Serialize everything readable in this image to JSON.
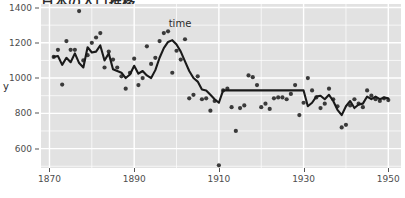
{
  "chart_data": {
    "type": "scatter",
    "title": "日本の人口推移",
    "xlabel": "time",
    "ylabel": "y",
    "xlim": [
      1868,
      1953
    ],
    "ylim": [
      490,
      1420
    ],
    "grid": true,
    "legend": "none",
    "x_ticks": [
      1870,
      1890,
      1910,
      1930,
      1950
    ],
    "y_ticks": [
      600,
      800,
      1000,
      1200,
      1400
    ],
    "point_color": "#3a3a3a",
    "line_color": "#1a1a1a",
    "panel_color": "#e2e2e2",
    "grid_color": "#ffffff",
    "series": [
      {
        "name": "observations",
        "type": "scatter",
        "x": [
          1871,
          1872,
          1873,
          1874,
          1875,
          1876,
          1877,
          1878,
          1879,
          1880,
          1881,
          1882,
          1883,
          1884,
          1885,
          1886,
          1887,
          1888,
          1889,
          1890,
          1891,
          1892,
          1893,
          1894,
          1895,
          1896,
          1897,
          1898,
          1899,
          1900,
          1901,
          1902,
          1903,
          1904,
          1905,
          1906,
          1907,
          1908,
          1909,
          1910,
          1911,
          1912,
          1913,
          1914,
          1915,
          1916,
          1917,
          1918,
          1919,
          1920,
          1921,
          1922,
          1923,
          1924,
          1925,
          1926,
          1927,
          1928,
          1929,
          1930,
          1931,
          1932,
          1933,
          1934,
          1935,
          1936,
          1937,
          1938,
          1939,
          1940,
          1941,
          1942,
          1943,
          1944,
          1945,
          1946,
          1947,
          1948,
          1949,
          1950
        ],
        "y": [
          1120,
          1160,
          963,
          1210,
          1160,
          1160,
          1380,
          1100,
          1130,
          1200,
          1230,
          1255,
          1060,
          1150,
          1105,
          1060,
          1010,
          940,
          1030,
          1110,
          960,
          1000,
          1180,
          1080,
          1115,
          1210,
          1255,
          1265,
          1030,
          1155,
          1105,
          1220,
          885,
          905,
          1010,
          880,
          885,
          815,
          870,
          505,
          930,
          940,
          835,
          700,
          830,
          845,
          1015,
          1005,
          960,
          835,
          855,
          825,
          885,
          890,
          890,
          880,
          910,
          960,
          790,
          860,
          1000,
          930,
          890,
          830,
          855,
          940,
          880,
          840,
          720,
          735,
          845,
          880,
          855,
          835,
          930,
          900,
          880,
          870,
          885,
          875
        ]
      },
      {
        "name": "trend-line",
        "type": "line",
        "x": [
          1871,
          1872,
          1873,
          1874,
          1875,
          1876,
          1877,
          1878,
          1879,
          1880,
          1881,
          1882,
          1883,
          1884,
          1885,
          1886,
          1887,
          1888,
          1889,
          1890,
          1891,
          1892,
          1893,
          1894,
          1895,
          1896,
          1897,
          1898,
          1899,
          1900,
          1901,
          1902,
          1903,
          1904,
          1905,
          1906,
          1907,
          1908,
          1909,
          1910,
          1911,
          1912,
          1913,
          1914,
          1915,
          1916,
          1917,
          1918,
          1919,
          1920,
          1921,
          1922,
          1923,
          1924,
          1925,
          1926,
          1927,
          1928,
          1929,
          1930,
          1931,
          1932,
          1933,
          1934,
          1935,
          1936,
          1937,
          1938,
          1939,
          1940,
          1941,
          1942,
          1943,
          1944,
          1945,
          1946,
          1947,
          1948,
          1949,
          1950
        ],
        "y": [
          1120,
          1125,
          1075,
          1115,
          1090,
          1140,
          1085,
          1060,
          1175,
          1145,
          1150,
          1185,
          1100,
          1140,
          1050,
          1040,
          1030,
          1000,
          1020,
          1070,
          1025,
          1040,
          1015,
          1000,
          1045,
          1115,
          1170,
          1205,
          1215,
          1190,
          1150,
          1095,
          1040,
          1000,
          980,
          935,
          930,
          905,
          880,
          860,
          930,
          930,
          930,
          930,
          930,
          930,
          930,
          930,
          930,
          930,
          930,
          930,
          930,
          930,
          930,
          930,
          930,
          930,
          930,
          930,
          840,
          860,
          895,
          900,
          880,
          905,
          870,
          820,
          790,
          840,
          870,
          830,
          850,
          855,
          895,
          880,
          895,
          880,
          890,
          885
        ]
      }
    ]
  }
}
